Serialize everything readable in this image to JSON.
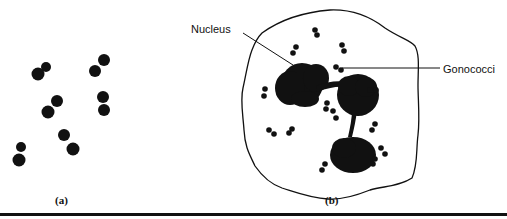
{
  "figure": {
    "colors": {
      "ink": "#111111",
      "background": "#ffffff"
    },
    "panel_a": {
      "caption": "(a)",
      "diplococci": [
        {
          "c1": [
            38,
            74,
            6.5
          ],
          "c2": [
            46,
            67,
            5
          ]
        },
        {
          "c1": [
            95,
            71,
            6
          ],
          "c2": [
            104,
            60,
            6
          ]
        },
        {
          "c1": [
            48,
            112,
            6.5
          ],
          "c2": [
            57,
            101,
            6
          ]
        },
        {
          "c1": [
            103,
            97,
            6
          ],
          "c2": [
            104,
            110,
            6
          ]
        },
        {
          "c1": [
            64,
            135,
            6
          ],
          "c2": [
            73,
            149,
            6.5
          ]
        },
        {
          "c1": [
            19,
            160,
            6.5
          ],
          "c2": [
            21,
            147,
            5
          ]
        }
      ]
    },
    "panel_b": {
      "caption": "(b)",
      "labels": {
        "nucleus": "Nucleus",
        "gonococci": "Gonococci"
      },
      "intracellular_diplococci": [
        {
          "c1": [
            315,
            30,
            2.8
          ],
          "c2": [
            317,
            35,
            2.8
          ]
        },
        {
          "c1": [
            342,
            45,
            2.8
          ],
          "c2": [
            344,
            51,
            2.8
          ]
        },
        {
          "c1": [
            296,
            47,
            2.8
          ],
          "c2": [
            293,
            53,
            2.8
          ]
        },
        {
          "c1": [
            336,
            67,
            2.8
          ],
          "c2": [
            341,
            70,
            2.8
          ]
        },
        {
          "c1": [
            370,
            90,
            2.8
          ],
          "c2": [
            376,
            90,
            2.8
          ]
        },
        {
          "c1": [
            265,
            89,
            2.8
          ],
          "c2": [
            264,
            96,
            2.8
          ]
        },
        {
          "c1": [
            327,
            103,
            2.8
          ],
          "c2": [
            326,
            109,
            2.8
          ]
        },
        {
          "c1": [
            333,
            111,
            2.8
          ],
          "c2": [
            336,
            118,
            2.8
          ]
        },
        {
          "c1": [
            269,
            130,
            2.8
          ],
          "c2": [
            274,
            134,
            2.8
          ]
        },
        {
          "c1": [
            292,
            129,
            2.8
          ],
          "c2": [
            289,
            133,
            2.8
          ]
        },
        {
          "c1": [
            375,
            124,
            2.8
          ],
          "c2": [
            372,
            130,
            2.8
          ]
        },
        {
          "c1": [
            381,
            148,
            2.8
          ],
          "c2": [
            385,
            154,
            2.8
          ]
        },
        {
          "c1": [
            375,
            159,
            2.8
          ],
          "c2": [
            373,
            164,
            2.8
          ]
        },
        {
          "c1": [
            325,
            164,
            2.8
          ],
          "c2": [
            322,
            170,
            2.8
          ]
        }
      ]
    }
  }
}
